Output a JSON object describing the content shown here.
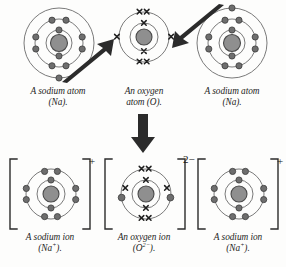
{
  "figure": {
    "background_color": "#fdfdfc",
    "ink_color": "#1d1d1d",
    "nucleus_fill": "#8f8f8f",
    "nucleus_stroke": "#4a4a4a",
    "electron_dot_fill": "#6e6e6e",
    "electron_dot_stroke": "#3c3c3c",
    "shell_stroke": "#6b6b6b",
    "arrow_fill": "#2b2b2b"
  },
  "top_row": {
    "items": [
      {
        "id": "sodium-atom-left",
        "element": "Na",
        "caption_line1": "A sodium atom",
        "caption_line2": "(Na).",
        "electron_symbol": "dot",
        "shells": [
          2,
          8,
          1
        ],
        "shell_radii": [
          13,
          24,
          35
        ]
      },
      {
        "id": "oxygen-atom",
        "element": "O",
        "caption_line1": "An oxygen",
        "caption_line2": "atom (O).",
        "electron_symbol": "cross",
        "shells": [
          2,
          6
        ],
        "shell_radii": [
          14,
          27
        ]
      },
      {
        "id": "sodium-atom-right",
        "element": "Na",
        "caption_line1": "A sodium atom",
        "caption_line2": "(Na).",
        "electron_symbol": "dot",
        "shells": [
          2,
          8,
          1
        ],
        "shell_radii": [
          13,
          24,
          35
        ]
      }
    ]
  },
  "bottom_row": {
    "items": [
      {
        "id": "sodium-ion-left",
        "element": "Na",
        "caption_line1": "A sodium ion",
        "caption_line2_base": "(Na",
        "caption_line2_charge": "+",
        "caption_line2_tail": ").",
        "charge_label": "+",
        "electron_symbol": "dot",
        "shells": [
          2,
          8
        ],
        "shell_radii": [
          14,
          27
        ],
        "bracketed": true
      },
      {
        "id": "oxygen-ion",
        "element": "O",
        "caption_line1": "An oxygen ion",
        "caption_line2_base": "(O",
        "caption_line2_charge": "2−",
        "caption_line2_tail": ").",
        "charge_label": "2−",
        "electron_symbol": "cross",
        "shells": [
          2,
          8
        ],
        "shell_radii": [
          14,
          27
        ],
        "bracketed": true,
        "transferred_electrons": 2
      },
      {
        "id": "sodium-ion-right",
        "element": "Na",
        "caption_line1": "A sodium ion",
        "caption_line2_base": "(Na",
        "caption_line2_charge": "+",
        "caption_line2_tail": ").",
        "charge_label": "+",
        "electron_symbol": "dot",
        "shells": [
          2,
          8
        ],
        "shell_radii": [
          14,
          27
        ],
        "bracketed": true
      }
    ]
  },
  "arrows": [
    {
      "id": "transfer-arrow-left",
      "direction": "up-right",
      "meaning": "electron transfer from left sodium to oxygen"
    },
    {
      "id": "transfer-arrow-right",
      "direction": "down-left",
      "meaning": "electron transfer from right sodium to oxygen"
    },
    {
      "id": "reaction-arrow-down",
      "direction": "down",
      "meaning": "reaction proceeds to ions"
    }
  ]
}
